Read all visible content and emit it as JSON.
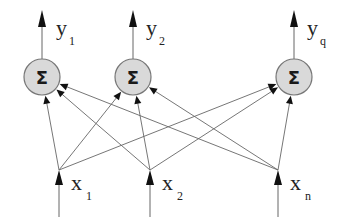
{
  "diagram": {
    "type": "single-layer-network",
    "colors": {
      "node_fill": "#d9d9d9",
      "node_stroke": "#777777",
      "line": "#666666",
      "arrow": "#111111",
      "text": "#222222"
    },
    "outputs": [
      {
        "symbol": "y",
        "subscript": "1",
        "x": 42
      },
      {
        "symbol": "y",
        "subscript": "2",
        "x": 133
      },
      {
        "symbol": "y",
        "subscript": "q",
        "x": 294
      }
    ],
    "nodes": [
      {
        "label": "Σ",
        "cx": 42,
        "cy": 77
      },
      {
        "label": "Σ",
        "cx": 133,
        "cy": 77
      },
      {
        "label": "Σ",
        "cx": 294,
        "cy": 77
      }
    ],
    "inputs": [
      {
        "symbol": "x",
        "subscript": "1",
        "x": 59
      },
      {
        "symbol": "x",
        "subscript": "2",
        "x": 150
      },
      {
        "symbol": "x",
        "subscript": "n",
        "x": 278
      }
    ]
  }
}
